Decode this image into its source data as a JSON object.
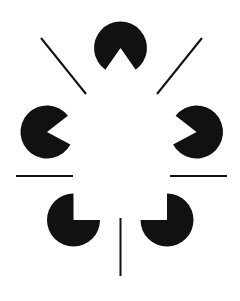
{
  "figure": {
    "canvas": {
      "width": 240,
      "height": 301,
      "background_color": "#ffffff"
    },
    "ink_color": "#111111",
    "discs": [
      {
        "name": "top-disc",
        "label": "Top pac-man disc",
        "cx": 120.5,
        "cy": 48,
        "r": 26.5,
        "notch_start_deg": 55,
        "notch_end_deg": 125,
        "notch_points_to": "down"
      },
      {
        "name": "left-disc",
        "label": "Left pac-man disc",
        "cx": 47,
        "cy": 132,
        "r": 26.5,
        "notch_start_deg": -38,
        "notch_end_deg": 28,
        "notch_points_to": "right"
      },
      {
        "name": "right-disc",
        "label": "Right pac-man disc",
        "cx": 196.5,
        "cy": 132,
        "r": 26.5,
        "notch_start_deg": 152,
        "notch_end_deg": 218,
        "notch_points_to": "left"
      },
      {
        "name": "bottom-left-disc",
        "label": "Bottom left pac-man disc",
        "cx": 73.5,
        "cy": 220,
        "r": 26.5,
        "notch_start_deg": -90,
        "notch_end_deg": 0,
        "notch_points_to": "up-right"
      },
      {
        "name": "bottom-right-disc",
        "label": "Bottom right pac-man disc",
        "cx": 167,
        "cy": 220,
        "r": 26.5,
        "notch_start_deg": 180,
        "notch_end_deg": 270,
        "notch_points_to": "up-left"
      }
    ],
    "lines": [
      {
        "name": "upper-left-diagonal-line",
        "label": "Upper left diagonal segment",
        "x1": 41,
        "y1": 38,
        "x2": 86,
        "y2": 94,
        "thickness": 2
      },
      {
        "name": "upper-right-diagonal-line",
        "label": "Upper right diagonal segment",
        "x1": 202,
        "y1": 38,
        "x2": 157,
        "y2": 94,
        "thickness": 2
      },
      {
        "name": "left-horizontal-line",
        "label": "Left horizontal segment",
        "x1": 16,
        "y1": 176,
        "x2": 73,
        "y2": 176,
        "thickness": 2
      },
      {
        "name": "right-horizontal-line",
        "label": "Right horizontal segment",
        "x1": 170,
        "y1": 176,
        "x2": 227,
        "y2": 176,
        "thickness": 2
      },
      {
        "name": "bottom-vertical-line",
        "label": "Bottom vertical segment",
        "x1": 120.5,
        "y1": 218,
        "x2": 120.5,
        "y2": 276,
        "thickness": 2
      }
    ]
  }
}
